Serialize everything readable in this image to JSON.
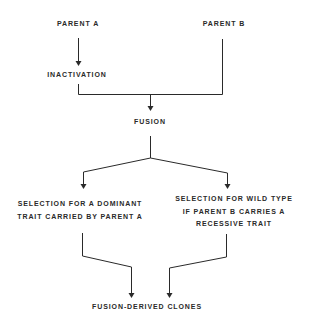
{
  "diagram": {
    "type": "flowchart",
    "line_color": "#2a2a2a",
    "nodes": {
      "parent_a": {
        "label": "PARENT A"
      },
      "parent_b": {
        "label": "PARENT B"
      },
      "inactivation": {
        "label": "INACTIVATION"
      },
      "fusion": {
        "label": "FUSION"
      },
      "selection_dominant": {
        "lines": [
          "SELECTION FOR A DOMINANT",
          "TRAIT CARRIED BY PARENT A"
        ]
      },
      "selection_wild": {
        "lines": [
          "SELECTION FOR WILD TYPE",
          "IF PARENT B CARRIES A",
          "RECESSIVE TRAIT"
        ]
      },
      "clones": {
        "label": "FUSION-DERIVED CLONES"
      }
    },
    "edges": [
      {
        "from": "parent_a",
        "to": "inactivation",
        "arrow": true
      },
      {
        "from": "inactivation",
        "to": "fusion",
        "arrow": true,
        "joined_with": "parent_b"
      },
      {
        "from": "parent_b",
        "to": "fusion",
        "arrow": true,
        "joined_with": "inactivation"
      },
      {
        "from": "fusion",
        "to": "selection_dominant",
        "arrow": true
      },
      {
        "from": "fusion",
        "to": "selection_wild",
        "arrow": true
      },
      {
        "from": "selection_dominant",
        "to": "clones",
        "arrow": true
      },
      {
        "from": "selection_wild",
        "to": "clones",
        "arrow": true
      }
    ]
  }
}
